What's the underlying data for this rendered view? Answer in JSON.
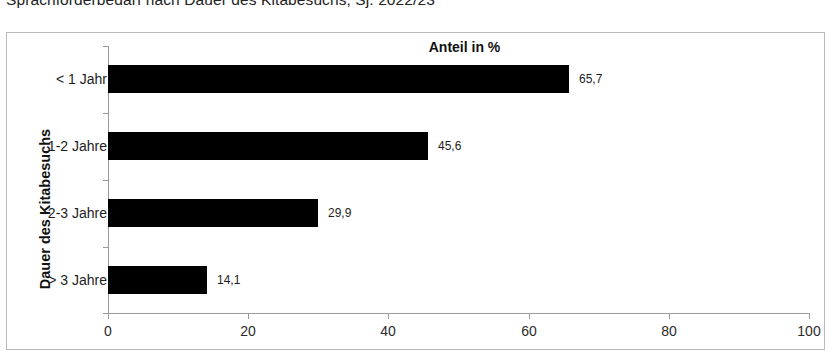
{
  "page_title": "Sprachförderbedarf nach Dauer des Kitabesuchs, Sj. 2022/23",
  "chart_data": {
    "type": "bar",
    "orientation": "horizontal",
    "title": "Anteil in %",
    "subtitle": "",
    "xlabel": "",
    "ylabel": "Dauer des Kitabesuchs",
    "categories": [
      "< 1 Jahr",
      "1-2 Jahre",
      "2-3 Jahre",
      "> 3 Jahre"
    ],
    "values": [
      65.7,
      45.6,
      29.9,
      14.1
    ],
    "value_labels": [
      "65,7",
      "45,6",
      "29,9",
      "14,1"
    ],
    "xlim": [
      0,
      100
    ],
    "xticks": [
      0,
      20,
      40,
      60,
      80,
      100
    ],
    "xtick_labels": [
      "0",
      "20",
      "40",
      "60",
      "80",
      "100"
    ],
    "grid": false,
    "legend": false,
    "bar_color": "#000000",
    "frame_color": "#b9b9b9",
    "axis_color": "#9a9a9a"
  }
}
